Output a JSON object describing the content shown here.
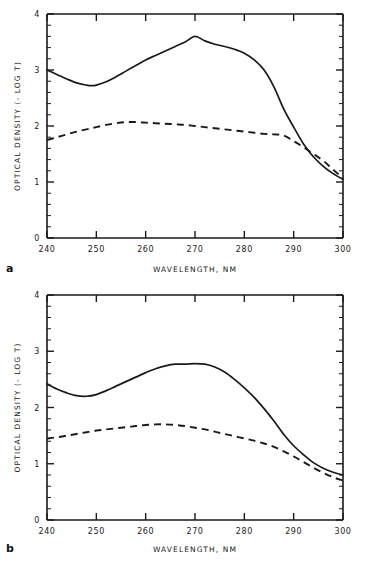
{
  "figure": {
    "panels": [
      {
        "letter": "a",
        "xlabel": "WAVELENGTH, NM",
        "ylabel": "OPTICAL DENSITY (- LOG T)"
      },
      {
        "letter": "b",
        "xlabel": "WAVELENGTH, NM",
        "ylabel": "OPTICAL DENSITY (- LOG T)"
      }
    ]
  },
  "chart_data": [
    {
      "type": "line",
      "title": "",
      "panel_label": "a",
      "xlabel": "WAVELENGTH, NM",
      "ylabel": "OPTICAL DENSITY (- LOG T)",
      "xlim": [
        240,
        300
      ],
      "ylim": [
        0,
        4
      ],
      "xticks": [
        240,
        250,
        260,
        270,
        280,
        290,
        300
      ],
      "yticks": [
        0,
        1,
        2,
        3,
        4
      ],
      "x_minor_step": 2,
      "y_minor_step": 0.2,
      "grid": false,
      "legend": "none",
      "x": [
        240,
        242,
        244,
        246,
        248,
        249,
        250,
        252,
        254,
        256,
        258,
        260,
        262,
        264,
        266,
        268,
        270,
        272,
        274,
        276,
        278,
        280,
        282,
        284,
        286,
        288,
        290,
        292,
        294,
        296,
        298,
        300
      ],
      "series": [
        {
          "name": "solid-curve",
          "style": "solid",
          "values": [
            3.0,
            2.92,
            2.84,
            2.77,
            2.73,
            2.72,
            2.73,
            2.79,
            2.88,
            2.98,
            3.08,
            3.18,
            3.26,
            3.34,
            3.42,
            3.5,
            3.6,
            3.52,
            3.46,
            3.42,
            3.37,
            3.3,
            3.18,
            3.0,
            2.7,
            2.3,
            1.98,
            1.68,
            1.45,
            1.28,
            1.15,
            1.05
          ]
        },
        {
          "name": "dashed-curve",
          "style": "dashed",
          "values": [
            1.75,
            1.8,
            1.85,
            1.9,
            1.94,
            1.96,
            1.98,
            2.02,
            2.05,
            2.07,
            2.07,
            2.06,
            2.05,
            2.04,
            2.03,
            2.02,
            2.0,
            1.98,
            1.96,
            1.94,
            1.92,
            1.9,
            1.88,
            1.86,
            1.85,
            1.83,
            1.73,
            1.62,
            1.5,
            1.38,
            1.22,
            1.07
          ]
        }
      ]
    },
    {
      "type": "line",
      "title": "",
      "panel_label": "b",
      "xlabel": "WAVELENGTH, NM",
      "ylabel": "OPTICAL DENSITY (- LOG T)",
      "xlim": [
        240,
        300
      ],
      "ylim": [
        0,
        4
      ],
      "xticks": [
        240,
        250,
        260,
        270,
        280,
        290,
        300
      ],
      "yticks": [
        0,
        1,
        2,
        3,
        4
      ],
      "x_minor_step": 2,
      "y_minor_step": 0.2,
      "grid": false,
      "legend": "none",
      "x": [
        240,
        242,
        244,
        246,
        248,
        250,
        252,
        254,
        256,
        258,
        260,
        262,
        264,
        266,
        268,
        270,
        272,
        274,
        276,
        278,
        280,
        282,
        284,
        286,
        288,
        290,
        292,
        294,
        296,
        298,
        300
      ],
      "series": [
        {
          "name": "solid-curve",
          "style": "solid",
          "values": [
            2.42,
            2.33,
            2.26,
            2.21,
            2.2,
            2.23,
            2.3,
            2.38,
            2.46,
            2.54,
            2.62,
            2.69,
            2.74,
            2.77,
            2.77,
            2.78,
            2.77,
            2.72,
            2.63,
            2.5,
            2.35,
            2.18,
            1.98,
            1.76,
            1.52,
            1.32,
            1.16,
            1.02,
            0.92,
            0.85,
            0.8
          ]
        },
        {
          "name": "dashed-curve",
          "style": "dashed",
          "values": [
            1.45,
            1.47,
            1.5,
            1.53,
            1.56,
            1.59,
            1.61,
            1.63,
            1.65,
            1.67,
            1.69,
            1.7,
            1.7,
            1.69,
            1.67,
            1.64,
            1.61,
            1.57,
            1.53,
            1.49,
            1.45,
            1.41,
            1.36,
            1.3,
            1.22,
            1.13,
            1.03,
            0.93,
            0.84,
            0.76,
            0.7
          ]
        }
      ]
    }
  ]
}
